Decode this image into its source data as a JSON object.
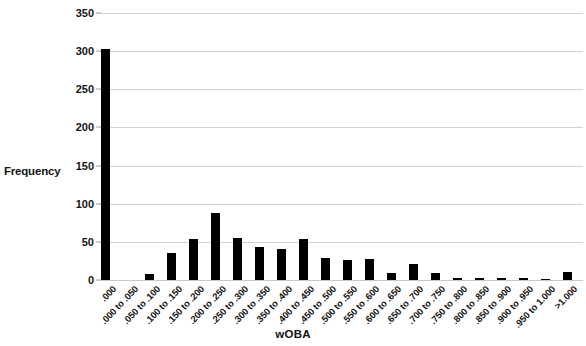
{
  "chart_data": {
    "type": "bar",
    "title": "",
    "xlabel": "wOBA",
    "ylabel": "Frequency",
    "ylim": [
      0,
      350
    ],
    "yticks": [
      0,
      50,
      100,
      150,
      200,
      250,
      300,
      350
    ],
    "grid": true,
    "legend": false,
    "bar_color": "#000000",
    "gridline_color": "#d2d2d2",
    "categories": [
      ".000",
      ".000 to .050",
      ".050 to .100",
      ".100 to .150",
      ".150 to .200",
      ".200 to .250",
      ".250 to .300",
      ".300 to .350",
      ".350 to .400",
      ".400 to .450",
      ".450 to .500",
      ".500 to .550",
      ".550 to .600",
      ".600 to .650",
      ".650 to .700",
      ".700 to .750",
      ".750 to .800",
      ".800 to .850",
      ".850 to .900",
      ".900 to .950",
      ".950 to 1.000",
      ">1.000"
    ],
    "values": [
      303,
      0,
      8,
      35,
      54,
      88,
      55,
      43,
      41,
      54,
      29,
      26,
      27,
      9,
      21,
      9,
      3,
      3,
      3,
      2,
      1,
      10
    ]
  }
}
